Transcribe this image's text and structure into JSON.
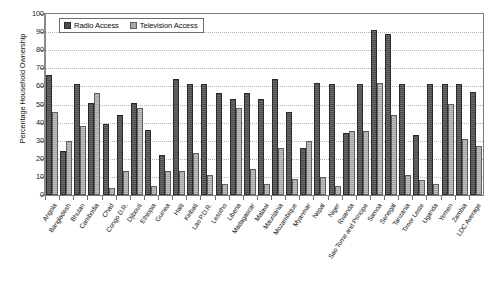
{
  "chart_data": {
    "type": "bar",
    "title": "",
    "xlabel": "",
    "ylabel": "Percentage Household Ownership",
    "ylim": [
      0,
      100
    ],
    "ytick_step": 10,
    "yticks": [
      0,
      10,
      20,
      30,
      40,
      50,
      60,
      70,
      80,
      90,
      100
    ],
    "grid": true,
    "legend_position": "top-left-inside",
    "categories": [
      "Angola",
      "Bangladesh",
      "Bhutan",
      "Cambodia",
      "Chad",
      "Congo D.R.",
      "Djibouti",
      "Ethiopia",
      "Guinea",
      "Haiti",
      "Kiribati",
      "Lao P.D.R.",
      "Lesotho",
      "Liberia",
      "Madagascar",
      "Malawi",
      "Mauritania",
      "Mozambique",
      "Myanmar",
      "Nepal",
      "Niger",
      "Rwanda",
      "Sao Tome and Principe",
      "Samoa",
      "Senegal",
      "Tanzania",
      "Timor Leste",
      "Uganda",
      "Yemen",
      "Zambia",
      "LDC Average"
    ],
    "series": [
      {
        "name": "Radio Access",
        "color": "#4d4d4d",
        "values": [
          65,
          23,
          60,
          50,
          38,
          43,
          50,
          35,
          21,
          63,
          60,
          60,
          55,
          52,
          55,
          52,
          63,
          45,
          25,
          61,
          60,
          33,
          60,
          90,
          88,
          60,
          32,
          60,
          60,
          60,
          56
        ]
      },
      {
        "name": "Television Access",
        "color": "#a6a6a6",
        "values": [
          45,
          29,
          37,
          55,
          3,
          12,
          47,
          4,
          12,
          12,
          22,
          10,
          5,
          47,
          13,
          5,
          25,
          8,
          29,
          9,
          4,
          34,
          34,
          61,
          43,
          10,
          7,
          5,
          49,
          30,
          26
        ]
      }
    ]
  },
  "legend": {
    "items": [
      {
        "label": "Radio Access",
        "swatch": "radio-swatch-icon"
      },
      {
        "label": "Television Access",
        "swatch": "television-swatch-icon"
      }
    ]
  }
}
